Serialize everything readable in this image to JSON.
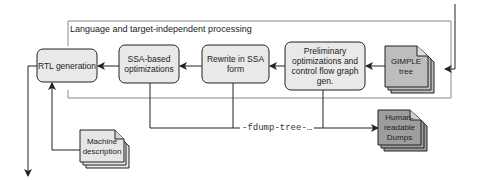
{
  "diagram": {
    "region_title": "Language and target-independent processing",
    "nodes": {
      "rtl": "RTL generation",
      "ssa_opt": "SSA-based optimizations",
      "rewrite": "Rewrite in SSA form",
      "prelim": "Preliminary optimizations and control flow graph gen.",
      "gimple": "GIMPLE tree",
      "machine": "Machine description",
      "dumps": "Human-readable Dumps"
    },
    "edge_label": "-fdump-tree-…",
    "colors": {
      "stroke": "#222222",
      "process_fill": "#e9e9e9",
      "doc_fill": "#bdbdbd",
      "doc_light_fill": "#e6e6e6",
      "region_stroke": "#8a8a8a"
    }
  }
}
